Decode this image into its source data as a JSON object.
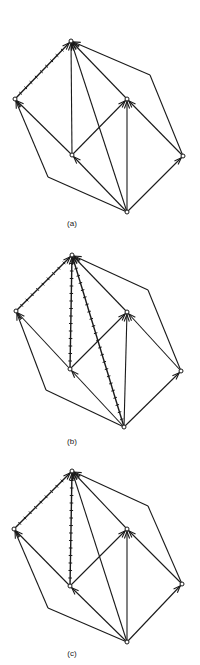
{
  "figure": {
    "stroke_color": "#1a1a1a",
    "panels": [
      {
        "id": "a",
        "caption": "(a)",
        "caption_pos": [
          70,
          225
        ],
        "nodes": {
          "T": [
            71,
            41
          ],
          "L": [
            15,
            99
          ],
          "M": [
            72,
            155
          ],
          "R": [
            127,
            99
          ],
          "F": [
            183,
            156
          ],
          "B": [
            127,
            212
          ]
        },
        "bends": {
          "BL": [
            48,
            177
          ],
          "FT": [
            150,
            75
          ]
        },
        "edges": [
          {
            "from": "L",
            "to": "T",
            "hatched": true
          },
          {
            "from": "M",
            "to": "T",
            "hatched": false
          },
          {
            "from": "B",
            "to": "T",
            "hatched": false
          },
          {
            "from": "R",
            "to": "T",
            "hatched": false
          },
          {
            "from": "F",
            "to": "T",
            "via": "FT",
            "hatched": false
          },
          {
            "from": "M",
            "to": "L",
            "hatched": false
          },
          {
            "from": "B",
            "to": "L",
            "via": "BL",
            "hatched": false
          },
          {
            "from": "M",
            "to": "R",
            "hatched": false
          },
          {
            "from": "B",
            "to": "R",
            "hatched": false
          },
          {
            "from": "F",
            "to": "R",
            "hatched": false
          },
          {
            "from": "B",
            "to": "M",
            "hatched": false
          },
          {
            "from": "B",
            "to": "F",
            "hatched": false
          }
        ]
      },
      {
        "id": "b",
        "caption": "(b)",
        "caption_pos": [
          72,
          443
        ],
        "nodes": {
          "T": [
            72,
            255
          ],
          "L": [
            16,
            311
          ],
          "M": [
            70,
            369
          ],
          "R": [
            127,
            312
          ],
          "F": [
            181,
            371
          ],
          "B": [
            124,
            427
          ]
        },
        "bends": {
          "BL": [
            46,
            390
          ],
          "FT": [
            148,
            290
          ]
        },
        "edges": [
          {
            "from": "L",
            "to": "T",
            "hatched": true
          },
          {
            "from": "M",
            "to": "T",
            "hatched": true
          },
          {
            "from": "B",
            "to": "T",
            "hatched": true
          },
          {
            "from": "R",
            "to": "T",
            "hatched": false
          },
          {
            "from": "F",
            "to": "T",
            "via": "FT",
            "hatched": false
          },
          {
            "from": "M",
            "to": "L",
            "hatched": false
          },
          {
            "from": "B",
            "to": "L",
            "via": "BL",
            "hatched": false
          },
          {
            "from": "M",
            "to": "R",
            "hatched": false
          },
          {
            "from": "B",
            "to": "R",
            "hatched": false
          },
          {
            "from": "F",
            "to": "R",
            "hatched": false
          },
          {
            "from": "B",
            "to": "M",
            "hatched": false
          },
          {
            "from": "B",
            "to": "F",
            "hatched": false
          }
        ]
      },
      {
        "id": "c",
        "caption": "(c)",
        "caption_pos": [
          72,
          655
        ],
        "nodes": {
          "T": [
            72,
            471
          ],
          "L": [
            14,
            529
          ],
          "M": [
            70,
            586
          ],
          "R": [
            127,
            529
          ],
          "F": [
            182,
            584
          ],
          "B": [
            127,
            642
          ]
        },
        "bends": {
          "BL": [
            48,
            608
          ],
          "FT": [
            148,
            506
          ]
        },
        "edges": [
          {
            "from": "L",
            "to": "T",
            "hatched": true
          },
          {
            "from": "M",
            "to": "T",
            "hatched": true
          },
          {
            "from": "B",
            "to": "T",
            "hatched": false
          },
          {
            "from": "R",
            "to": "T",
            "hatched": false
          },
          {
            "from": "F",
            "to": "T",
            "via": "FT",
            "hatched": false
          },
          {
            "from": "M",
            "to": "L",
            "hatched": false
          },
          {
            "from": "B",
            "to": "L",
            "via": "BL",
            "hatched": false
          },
          {
            "from": "M",
            "to": "R",
            "hatched": false
          },
          {
            "from": "B",
            "to": "R",
            "hatched": false
          },
          {
            "from": "F",
            "to": "R",
            "hatched": false
          },
          {
            "from": "B",
            "to": "M",
            "hatched": false
          },
          {
            "from": "B",
            "to": "F",
            "hatched": false
          }
        ]
      }
    ]
  }
}
